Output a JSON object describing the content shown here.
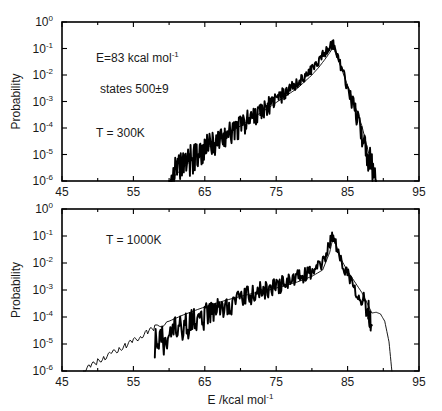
{
  "figure": {
    "panels": [
      {
        "id": "top",
        "annotations": [
          {
            "text_base": "E=83 kcal mol",
            "text_sup": "-1"
          },
          {
            "text_base": "states 500±9",
            "text_sup": ""
          },
          {
            "text_base": "T = 300K",
            "text_sup": ""
          }
        ],
        "ylabel": "Probability",
        "xlabel": "",
        "xtick_labels": [
          "45",
          "55",
          "65",
          "75",
          "85",
          "95"
        ],
        "ytick_bases": [
          "10",
          "10",
          "10",
          "10",
          "10",
          "10",
          "10"
        ],
        "ytick_sups": [
          "0",
          "-1",
          "-2",
          "-3",
          "-4",
          "-5",
          "-6"
        ]
      },
      {
        "id": "bottom",
        "annotations": [
          {
            "text_base": "T = 1000K",
            "text_sup": ""
          }
        ],
        "ylabel": "Probability",
        "xlabel_base": "E /kcal mol",
        "xlabel_sup": "-1",
        "xtick_labels": [
          "45",
          "55",
          "65",
          "75",
          "85",
          "95"
        ],
        "ytick_bases": [
          "10",
          "10",
          "10",
          "10",
          "10",
          "10",
          "10"
        ],
        "ytick_sups": [
          "0",
          "-1",
          "-2",
          "-3",
          "-4",
          "-5",
          "-6"
        ]
      }
    ]
  },
  "chart_data": {
    "type": "line",
    "title": "",
    "subtitle": "",
    "xlabel": "E /kcal mol^-1",
    "ylabel": "Probability",
    "xlim": [
      45,
      95
    ],
    "ylim": [
      1e-06,
      1
    ],
    "yscale": "log",
    "xticks": [
      45,
      55,
      65,
      75,
      85,
      95
    ],
    "yticks": [
      1,
      0.1,
      0.01,
      0.001,
      0.0001,
      1e-05,
      1e-06
    ],
    "grid": false,
    "legend": null,
    "panels": [
      {
        "name": "T = 300K",
        "annotations": [
          "E=83 kcal mol^-1",
          "states 500±9",
          "T = 300K"
        ],
        "peak_x": 83.0,
        "peak_y": 0.15,
        "series": [
          {
            "name": "simulation",
            "style": "thick-noisy",
            "x": [
              60.0,
              60.6,
              61.2,
              61.8,
              62.4,
              63.0,
              63.6,
              64.2,
              64.8,
              65.4,
              66.0,
              66.6,
              67.2,
              67.8,
              68.4,
              69.0,
              69.6,
              70.2,
              70.8,
              71.4,
              72.0,
              72.6,
              73.2,
              73.8,
              74.4,
              75.0,
              75.6,
              76.2,
              76.8,
              77.4,
              78.0,
              78.6,
              79.2,
              79.8,
              80.4,
              81.0,
              81.6,
              82.2,
              82.8,
              83.0,
              83.6,
              84.2,
              84.8,
              85.4,
              86.0,
              86.6,
              87.2,
              87.8,
              88.4,
              89.0
            ],
            "y": [
              1.2e-06,
              1.6e-06,
              2.2e-06,
              3e-06,
              4.5e-06,
              6e-06,
              8e-06,
              1.1e-05,
              1.4e-05,
              1.8e-05,
              2.3e-05,
              3e-05,
              3.8e-05,
              4.8e-05,
              6.2e-05,
              8e-05,
              0.0001,
              0.00013,
              0.00017,
              0.00022,
              0.00029,
              0.00038,
              0.0005,
              0.00065,
              0.00085,
              0.0011,
              0.0015,
              0.002,
              0.0027,
              0.0036,
              0.005,
              0.007,
              0.01,
              0.015,
              0.023,
              0.036,
              0.06,
              0.1,
              0.14,
              0.15,
              0.05,
              0.016,
              0.005,
              0.0016,
              0.0005,
              0.00015,
              4e-05,
              1e-05,
              2.5e-06,
              1e-06
            ],
            "noise_decades": 0.55
          },
          {
            "name": "theory",
            "style": "thin-smooth",
            "x": [
              60.0,
              62.0,
              64.0,
              66.0,
              68.0,
              70.0,
              72.0,
              74.0,
              76.0,
              78.0,
              80.0,
              81.0,
              82.0,
              83.0,
              84.0,
              85.0,
              86.0,
              87.0,
              88.0,
              89.0
            ],
            "y": [
              1e-06,
              3.2e-06,
              1e-05,
              2.4e-05,
              5.5e-05,
              0.00012,
              0.00027,
              0.0006,
              0.0014,
              0.0032,
              0.01,
              0.02,
              0.045,
              0.11,
              0.022,
              0.004,
              0.0007,
              0.00012,
              1e-05,
              1e-06
            ]
          }
        ]
      },
      {
        "name": "T = 1000K",
        "annotations": [
          "T = 1000K"
        ],
        "peak_x": 83.0,
        "peak_y": 0.12,
        "series": [
          {
            "name": "simulation",
            "style": "thick-noisy",
            "x": [
              58.0,
              58.8,
              59.6,
              60.4,
              61.2,
              62.0,
              62.8,
              63.6,
              64.4,
              65.2,
              66.0,
              66.8,
              67.6,
              68.4,
              69.2,
              70.0,
              70.8,
              71.6,
              72.4,
              73.2,
              74.0,
              74.8,
              75.6,
              76.4,
              77.2,
              78.0,
              78.8,
              79.6,
              80.4,
              81.2,
              82.0,
              82.6,
              83.0,
              83.6,
              84.4,
              85.2,
              86.0,
              86.8,
              87.6,
              88.0,
              88.4
            ],
            "y": [
              1e-05,
              1.3e-05,
              1.7e-05,
              2.2e-05,
              2.9e-05,
              3.8e-05,
              5e-05,
              6.5e-05,
              8.5e-05,
              0.00011,
              0.00014,
              0.00018,
              0.00023,
              0.00029,
              0.00036,
              0.00045,
              0.00055,
              0.00067,
              0.0008,
              0.00095,
              0.0011,
              0.0013,
              0.0016,
              0.0019,
              0.0023,
              0.0028,
              0.0034,
              0.0042,
              0.0055,
              0.008,
              0.02,
              0.07,
              0.12,
              0.025,
              0.008,
              0.0035,
              0.0015,
              0.0006,
              0.00025,
              0.00015,
              5e-05
            ],
            "noise_decades": 0.62
          },
          {
            "name": "theory",
            "style": "thin-smooth",
            "x": [
              48.0,
              49.0,
              50.0,
              51.0,
              52.0,
              53.0,
              54.0,
              55.0,
              56.0,
              57.0,
              58.0,
              60.0,
              62.0,
              64.0,
              66.0,
              68.0,
              70.0,
              72.0,
              74.0,
              76.0,
              78.0,
              80.0,
              81.5,
              82.5,
              83.0,
              84.0,
              85.0,
              86.0,
              87.0,
              87.8,
              88.4,
              89.0,
              89.6,
              90.2,
              90.8,
              91.2
            ],
            "y": [
              1e-06,
              1.5e-06,
              2.3e-06,
              3.2e-06,
              4.5e-06,
              6.5e-06,
              9e-06,
              1.3e-05,
              1.9e-05,
              2.8e-05,
              4e-05,
              7e-05,
              0.00012,
              0.00019,
              0.00029,
              0.00042,
              0.00058,
              0.00078,
              0.001,
              0.0014,
              0.002,
              0.0032,
              0.0055,
              0.025,
              0.1,
              0.015,
              0.005,
              0.002,
              0.0008,
              0.0003,
              0.00014,
              0.00015,
              0.00013,
              7e-05,
              1.2e-05,
              1e-06
            ]
          }
        ]
      }
    ]
  }
}
